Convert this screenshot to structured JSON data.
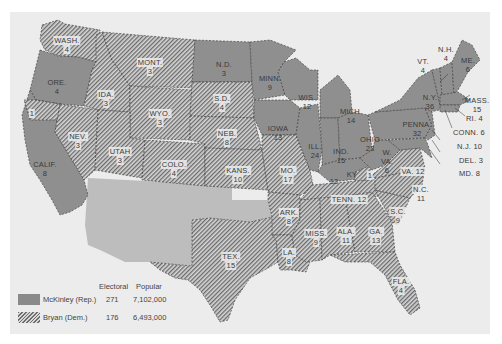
{
  "colors": {
    "background": "#ececec",
    "mckinley_fill": "#8f8f8f",
    "bryan_hatch_dark": "#6a6a6a",
    "bryan_hatch_light": "#d6d6d6",
    "territory_fill": "#bdbdbd",
    "label_text": "#3a3a3a"
  },
  "legend": {
    "header_electoral": "Electoral",
    "header_popular": "Popular",
    "entries": [
      {
        "candidate": "McKinley (Rep.)",
        "electoral": "271",
        "popular": "7,102,000",
        "pattern": "solid"
      },
      {
        "candidate": "Bryan (Dem.)",
        "electoral": "176",
        "popular": "6,493,000",
        "pattern": "hatched"
      }
    ]
  },
  "states": [
    {
      "abbr": "WASH.",
      "ev": "4",
      "winner": "Bryan"
    },
    {
      "abbr": "ORE.",
      "ev": "4",
      "winner": "McKinley"
    },
    {
      "abbr": "CALIF.",
      "ev": "8",
      "winner": "McKinley",
      "split_note": "1"
    },
    {
      "abbr": "IDA.",
      "ev": "3",
      "winner": "Bryan"
    },
    {
      "abbr": "NEV.",
      "ev": "3",
      "winner": "Bryan"
    },
    {
      "abbr": "MONT.",
      "ev": "3",
      "winner": "Bryan"
    },
    {
      "abbr": "WYO.",
      "ev": "3",
      "winner": "Bryan"
    },
    {
      "abbr": "UTAH",
      "ev": "3",
      "winner": "Bryan"
    },
    {
      "abbr": "COLO.",
      "ev": "4",
      "winner": "Bryan"
    },
    {
      "abbr": "N.D.",
      "ev": "3",
      "winner": "McKinley"
    },
    {
      "abbr": "S.D.",
      "ev": "4",
      "winner": "Bryan"
    },
    {
      "abbr": "NEB.",
      "ev": "8",
      "winner": "Bryan"
    },
    {
      "abbr": "KANS.",
      "ev": "10",
      "winner": "Bryan"
    },
    {
      "abbr": "TEX.",
      "ev": "15",
      "winner": "Bryan"
    },
    {
      "abbr": "MINN.",
      "ev": "9",
      "winner": "McKinley"
    },
    {
      "abbr": "IOWA",
      "ev": "13",
      "winner": "McKinley"
    },
    {
      "abbr": "MO.",
      "ev": "17",
      "winner": "Bryan"
    },
    {
      "abbr": "ARK.",
      "ev": "8",
      "winner": "Bryan"
    },
    {
      "abbr": "LA.",
      "ev": "8",
      "winner": "Bryan"
    },
    {
      "abbr": "WIS.",
      "ev": "12",
      "winner": "McKinley"
    },
    {
      "abbr": "ILL.",
      "ev": "24",
      "winner": "McKinley"
    },
    {
      "abbr": "MICH.",
      "ev": "14",
      "winner": "McKinley"
    },
    {
      "abbr": "IND.",
      "ev": "15",
      "winner": "McKinley"
    },
    {
      "abbr": "OHIO",
      "ev": "23",
      "winner": "McKinley"
    },
    {
      "abbr": "KY",
      "ev": "12",
      "winner": "McKinley",
      "split_note": "1"
    },
    {
      "abbr": "TENN.",
      "ev": "12",
      "winner": "Bryan"
    },
    {
      "abbr": "MISS.",
      "ev": "9",
      "winner": "Bryan"
    },
    {
      "abbr": "ALA.",
      "ev": "11",
      "winner": "Bryan"
    },
    {
      "abbr": "GA.",
      "ev": "13",
      "winner": "Bryan"
    },
    {
      "abbr": "FLA.",
      "ev": "4",
      "winner": "Bryan"
    },
    {
      "abbr": "S.C.",
      "ev": "9",
      "winner": "Bryan"
    },
    {
      "abbr": "N.C.",
      "ev": "11",
      "winner": "Bryan"
    },
    {
      "abbr": "VA.",
      "ev": "12",
      "winner": "Bryan"
    },
    {
      "abbr": "W. VA.",
      "ev": "6",
      "winner": "McKinley"
    },
    {
      "abbr": "PENNA.",
      "ev": "32",
      "winner": "McKinley"
    },
    {
      "abbr": "N.Y.",
      "ev": "36",
      "winner": "McKinley"
    },
    {
      "abbr": "VT.",
      "ev": "4",
      "winner": "McKinley"
    },
    {
      "abbr": "N.H.",
      "ev": "4",
      "winner": "McKinley"
    },
    {
      "abbr": "ME.",
      "ev": "6",
      "winner": "McKinley"
    },
    {
      "abbr": "MASS.",
      "ev": "15",
      "winner": "McKinley"
    },
    {
      "abbr": "RI.",
      "ev": "4",
      "winner": "McKinley"
    },
    {
      "abbr": "CONN.",
      "ev": "6",
      "winner": "McKinley"
    },
    {
      "abbr": "N.J.",
      "ev": "10",
      "winner": "McKinley"
    },
    {
      "abbr": "DEL.",
      "ev": "3",
      "winner": "McKinley"
    },
    {
      "abbr": "MD.",
      "ev": "8",
      "winner": "McKinley"
    }
  ],
  "labels": {
    "wash": {
      "name": "WASH.",
      "ev": "4"
    },
    "ore": {
      "name": "ORE.",
      "ev": "4"
    },
    "calif": {
      "name": "CALIF.",
      "ev": "8"
    },
    "calif_split": "1",
    "ida": {
      "name": "IDA.",
      "ev": "3"
    },
    "nev": {
      "name": "NEV.",
      "ev": "3"
    },
    "mont": {
      "name": "MONT.",
      "ev": "3"
    },
    "wyo": {
      "name": "WYO.",
      "ev": "3"
    },
    "utah": {
      "name": "UTAH",
      "ev": "3"
    },
    "colo": {
      "name": "COLO.",
      "ev": "4"
    },
    "nd": {
      "name": "N.D.",
      "ev": "3"
    },
    "sd": {
      "name": "S.D.",
      "ev": "4"
    },
    "neb": {
      "name": "NEB.",
      "ev": "8"
    },
    "kans": {
      "name": "KANS.",
      "ev": "10"
    },
    "tex": {
      "name": "TEX.",
      "ev": "15"
    },
    "minn": {
      "name": "MINN.",
      "ev": "9"
    },
    "iowa": {
      "name": "IOWA",
      "ev": "13"
    },
    "mo": {
      "name": "MO.",
      "ev": "17"
    },
    "ark": {
      "name": "ARK.",
      "ev": "8"
    },
    "la": {
      "name": "LA.",
      "ev": "8"
    },
    "wis": {
      "name": "WIS.",
      "ev": "12"
    },
    "ill": {
      "name": "ILL.",
      "ev": "24"
    },
    "mich": {
      "name": "MICH.",
      "ev": "14"
    },
    "ind": {
      "name": "IND.",
      "ev": "15"
    },
    "ohio": {
      "name": "OHIO",
      "ev": "23"
    },
    "ky_ev": "12",
    "ky_name": "KY",
    "ky_split": "1",
    "tenn": "TENN.  12",
    "miss": {
      "name": "MISS.",
      "ev": "9"
    },
    "ala": {
      "name": "ALA.",
      "ev": "11"
    },
    "ga": {
      "name": "GA.",
      "ev": "13"
    },
    "fla": {
      "name": "FLA.",
      "ev": "4"
    },
    "sc": {
      "name": "S.C.",
      "ev": "9"
    },
    "nc": {
      "name": "N.C.",
      "ev": "11"
    },
    "va": "VA. 12",
    "wva": {
      "name": "W.",
      "name2": "VA.",
      "ev": "6"
    },
    "penna": {
      "name": "PENNA.",
      "ev": "32"
    },
    "ny": {
      "name": "N.Y.",
      "ev": "36"
    },
    "vt": {
      "name": "VT.",
      "ev": "4"
    },
    "nh": {
      "name": "N.H.",
      "ev": "4"
    },
    "me": {
      "name": "ME.",
      "ev": "6"
    },
    "mass": {
      "name": "MASS.",
      "ev": "15"
    },
    "ri": "RI.  4",
    "conn": "CONN.  6",
    "nj": "N.J.  10",
    "del": "DEL.  3",
    "md": "MD.  8"
  }
}
